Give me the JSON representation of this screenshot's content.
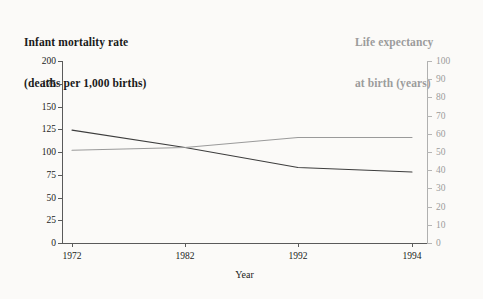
{
  "titles": {
    "left_line1": "Infant mortality rate",
    "left_line2": "(deaths per 1,000 births)",
    "right_line1": "Life expectancy",
    "right_line2": "at birth (years)"
  },
  "colors": {
    "infant_mortality_line": "#3d3d3d",
    "life_expectancy_line": "#9a9a9a",
    "left_axis_text": "#1a1a1a",
    "right_axis_text": "#9c9c9c",
    "background": "#fbfaf8"
  },
  "axis_titles": {
    "x": "Year",
    "left": "Infant mortality rate (deaths per 1,000 births)",
    "right": "Life expectancy at birth (years)"
  },
  "ticks": {
    "x": [
      "1972",
      "1982",
      "1992",
      "1994"
    ],
    "left": [
      "200",
      "175",
      "150",
      "125",
      "100",
      "75",
      "50",
      "25",
      "0"
    ],
    "right": [
      "100",
      "90",
      "80",
      "70",
      "60",
      "50",
      "40",
      "30",
      "20",
      "10",
      "0"
    ]
  },
  "chart_data": {
    "type": "line",
    "title": "",
    "xlabel": "Year",
    "ylabel": "Infant mortality rate (deaths per 1,000 births)",
    "y2label": "Life expectancy at birth (years)",
    "x": [
      "1972",
      "1982",
      "1992",
      "1994"
    ],
    "categories": [
      "1972",
      "1982",
      "1992",
      "1994"
    ],
    "ylim": [
      0,
      200
    ],
    "y2lim": [
      0,
      100
    ],
    "yticks": [
      0,
      25,
      50,
      75,
      100,
      125,
      150,
      175,
      200
    ],
    "y2ticks": [
      0,
      10,
      20,
      30,
      40,
      50,
      60,
      70,
      80,
      90,
      100
    ],
    "grid": false,
    "legend": "none",
    "series": [
      {
        "name": "Infant mortality rate (deaths per 1,000 births)",
        "axis": "left",
        "color": "#3d3d3d",
        "values": [
          124,
          105,
          83,
          78
        ]
      },
      {
        "name": "Life expectancy at birth (years)",
        "axis": "right",
        "color": "#9a9a9a",
        "values": [
          51,
          52.5,
          58,
          58
        ]
      }
    ]
  }
}
